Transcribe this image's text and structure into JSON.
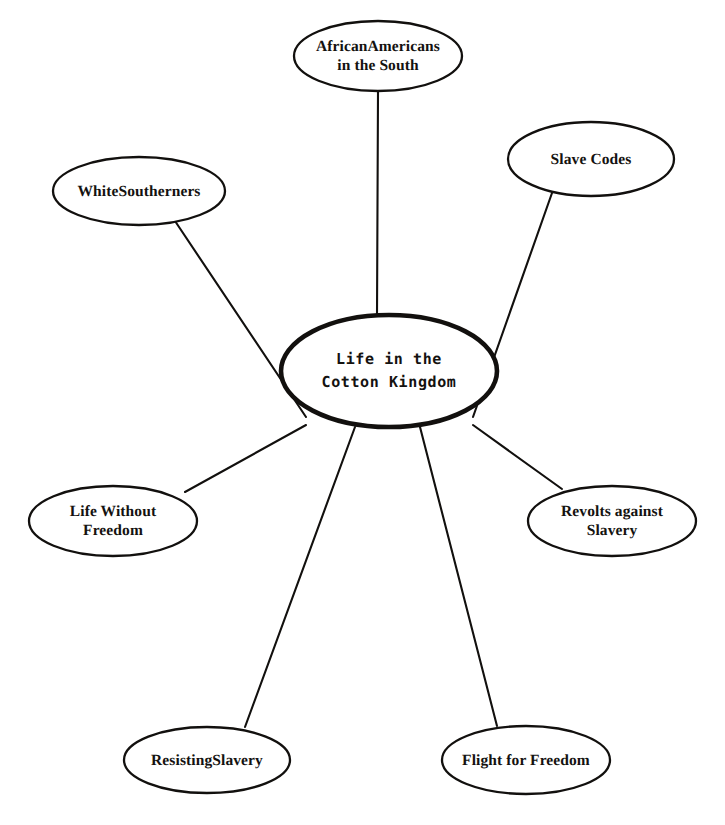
{
  "diagram": {
    "type": "concept-map",
    "title_node": "Life in the\nCotton Kingdom",
    "center": {
      "id": "center",
      "label": "Life in the\nCotton Kingdom",
      "cx": 389,
      "cy": 371,
      "rx": 108,
      "ry": 56,
      "emphasis": "bold-outline"
    },
    "nodes": [
      {
        "id": "african-americans-in-the-south",
        "label": "AfricanAmericans\nin the South",
        "cx": 378,
        "cy": 56,
        "rx": 84,
        "ry": 35
      },
      {
        "id": "slave-codes",
        "label": "Slave Codes",
        "cx": 591,
        "cy": 159,
        "rx": 83,
        "ry": 37
      },
      {
        "id": "white-southerners",
        "label": "WhiteSoutherners",
        "cx": 139,
        "cy": 191,
        "rx": 86,
        "ry": 34
      },
      {
        "id": "life-without-freedom",
        "label": "Life Without\nFreedom",
        "cx": 113,
        "cy": 521,
        "rx": 84,
        "ry": 35
      },
      {
        "id": "revolts-against-slavery",
        "label": "Revolts against\nSlavery",
        "cx": 612,
        "cy": 521,
        "rx": 84,
        "ry": 35
      },
      {
        "id": "resisting-slavery",
        "label": "ResistingSlavery",
        "cx": 207,
        "cy": 760,
        "rx": 83,
        "ry": 33
      },
      {
        "id": "flight-for-freedom",
        "label": "Flight for Freedom",
        "cx": 526,
        "cy": 760,
        "rx": 84,
        "ry": 34
      }
    ],
    "edges": [
      {
        "id": "edge-center-african-americans",
        "from": "center",
        "to": "african-americans-in-the-south",
        "x1": 377,
        "y1": 316,
        "x2": 378,
        "y2": 92
      },
      {
        "id": "edge-center-slave-codes",
        "from": "center",
        "to": "slave-codes",
        "x1": 473,
        "y1": 417,
        "x2": 552,
        "y2": 193
      },
      {
        "id": "edge-center-white-southerners",
        "from": "center",
        "to": "white-southerners",
        "x1": 306,
        "y1": 417,
        "x2": 175,
        "y2": 221
      },
      {
        "id": "edge-center-life-without-freedom",
        "from": "center",
        "to": "life-without-freedom",
        "x1": 306,
        "y1": 425,
        "x2": 185,
        "y2": 492
      },
      {
        "id": "edge-center-revolts-against-slavery",
        "from": "center",
        "to": "revolts-against-slavery",
        "x1": 473,
        "y1": 425,
        "x2": 562,
        "y2": 489
      },
      {
        "id": "edge-center-resisting-slavery",
        "from": "center",
        "to": "resisting-slavery",
        "x1": 355,
        "y1": 427,
        "x2": 245,
        "y2": 727
      },
      {
        "id": "edge-center-flight-for-freedom",
        "from": "center",
        "to": "flight-for-freedom",
        "x1": 420,
        "y1": 427,
        "x2": 497,
        "y2": 726
      }
    ],
    "colors": {
      "ink": "#12100e",
      "background": "#ffffff"
    }
  }
}
